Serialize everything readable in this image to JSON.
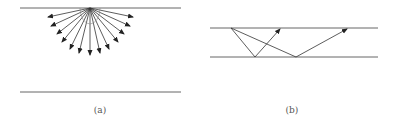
{
  "panels": [
    {
      "id": "a",
      "label": "(a)",
      "description": "Point source on upper boundary emitting rays in a fan",
      "top_line": {
        "x1": 20,
        "x2": 181,
        "y": 8
      },
      "bottom_line": {
        "x1": 20,
        "x2": 181,
        "y": 92
      },
      "source": {
        "x": 90,
        "y": 8
      },
      "ray_tips": [
        [
          48,
          17
        ],
        [
          51,
          26
        ],
        [
          57,
          34
        ],
        [
          62,
          42
        ],
        [
          70,
          49
        ],
        [
          79,
          53
        ],
        [
          90,
          55
        ],
        [
          100,
          53
        ],
        [
          109,
          49
        ],
        [
          118,
          42
        ],
        [
          124,
          34
        ],
        [
          130,
          26
        ],
        [
          133,
          17
        ]
      ]
    },
    {
      "id": "b",
      "label": "(b)",
      "description": "Rays reflecting off lower boundary back to upper boundary",
      "top_line": {
        "x1": 210,
        "x2": 378,
        "y": 28
      },
      "bottom_line": {
        "x1": 210,
        "x2": 378,
        "y": 57
      },
      "source": {
        "x": 231,
        "y": 28
      },
      "rays": [
        {
          "reflect": [
            255,
            57
          ],
          "tip": [
            280,
            29
          ]
        },
        {
          "reflect": [
            296,
            57
          ],
          "tip": [
            347,
            29
          ]
        }
      ]
    }
  ],
  "colors": {
    "line": "#666666",
    "ray": "#333333",
    "label": "#555555"
  }
}
